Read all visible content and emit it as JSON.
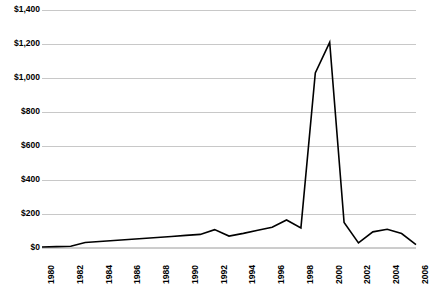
{
  "chart_data": {
    "type": "line",
    "title": "",
    "subtitle": "",
    "xlabel": "",
    "ylabel": "",
    "grid": true,
    "legend": false,
    "legend_position": "none",
    "line_color": "#000000",
    "gridline_color": "#c8c8c8",
    "background_color": "#ffffff",
    "ylim": [
      0,
      1400
    ],
    "ytick_values": [
      0,
      200,
      400,
      600,
      800,
      1000,
      1200,
      1400
    ],
    "ytick_labels": [
      "$0",
      "$200",
      "$400",
      "$600",
      "$800",
      "$1,000",
      "$1,200",
      "$1,400"
    ],
    "xlim": [
      1980,
      2006
    ],
    "xtick_values": [
      1980,
      1982,
      1984,
      1986,
      1988,
      1990,
      1992,
      1994,
      1996,
      1998,
      2000,
      2002,
      2004,
      2006
    ],
    "xtick_labels": [
      "1980",
      "1982",
      "1984",
      "1986",
      "1988",
      "1990",
      "1992",
      "1994",
      "1996",
      "1998",
      "2000",
      "2002",
      "2004",
      "2006"
    ],
    "x": [
      1980,
      1981,
      1982,
      1983,
      1984,
      1985,
      1986,
      1987,
      1988,
      1989,
      1990,
      1991,
      1992,
      1993,
      1994,
      1995,
      1996,
      1997,
      1998,
      1999,
      2000,
      2001,
      2002,
      2003,
      2004,
      2005,
      2006
    ],
    "values": [
      6,
      8,
      10,
      32,
      38,
      44,
      50,
      56,
      62,
      68,
      74,
      80,
      108,
      70,
      86,
      104,
      122,
      165,
      118,
      1030,
      1210,
      150,
      30,
      95,
      110,
      85,
      20
    ],
    "series": [
      {
        "name": "Value",
        "values": [
          6,
          8,
          10,
          32,
          38,
          44,
          50,
          56,
          62,
          68,
          74,
          80,
          108,
          70,
          86,
          104,
          122,
          165,
          118,
          1030,
          1210,
          150,
          30,
          95,
          110,
          85,
          20
        ]
      }
    ],
    "annotations": []
  },
  "geometry": {
    "plot_left": 42,
    "plot_right": 416,
    "plot_top": 10,
    "plot_bottom": 248
  }
}
